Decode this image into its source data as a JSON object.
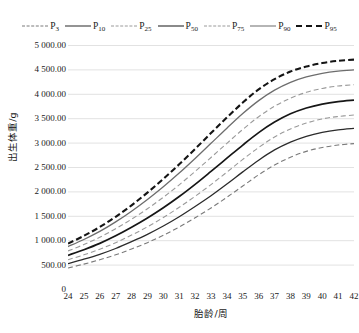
{
  "chart_data": {
    "type": "line",
    "title": "",
    "xlabel": "胎龄/周",
    "ylabel": "出生体重/g",
    "xlim": [
      24,
      42
    ],
    "ylim": [
      0,
      5000
    ],
    "ytick_step": 500,
    "grid": true,
    "legend_position": "top",
    "x": [
      24,
      25,
      26,
      27,
      28,
      29,
      30,
      31,
      32,
      33,
      34,
      35,
      36,
      37,
      38,
      39,
      40,
      41,
      42
    ],
    "xtick_labels": [
      "24",
      "25",
      "26",
      "27",
      "28",
      "29",
      "30",
      "31",
      "32",
      "33",
      "34",
      "35",
      "36",
      "37",
      "38",
      "39",
      "40",
      "41",
      "42"
    ],
    "ytick_labels": [
      "0",
      "500.00",
      "1 000.00",
      "1 500.00",
      "2 000.00",
      "2 500.00",
      "3 000.00",
      "3 500.00",
      "4 000.00",
      "4 500.00",
      "5 000.00"
    ],
    "ytick_values": [
      0,
      500,
      1000,
      1500,
      2000,
      2500,
      3000,
      3500,
      4000,
      4500,
      5000
    ],
    "series": [
      {
        "name": "P3",
        "label": "P",
        "sub": "3",
        "style": "dashed",
        "width": 1.1,
        "color": "#7a7a7a",
        "values": [
          430,
          510,
          600,
          700,
          820,
          950,
          1100,
          1270,
          1460,
          1660,
          1880,
          2110,
          2340,
          2540,
          2700,
          2820,
          2900,
          2950,
          2980
        ]
      },
      {
        "name": "P10",
        "label": "P",
        "sub": "10",
        "style": "solid",
        "width": 1.3,
        "color": "#2b2b2b",
        "values": [
          520,
          610,
          710,
          830,
          970,
          1120,
          1290,
          1480,
          1690,
          1910,
          2150,
          2400,
          2640,
          2850,
          3010,
          3130,
          3210,
          3260,
          3290
        ]
      },
      {
        "name": "P25",
        "label": "P",
        "sub": "25",
        "style": "dashed",
        "width": 1.1,
        "color": "#9a9a9a",
        "values": [
          600,
          700,
          815,
          950,
          1105,
          1275,
          1465,
          1675,
          1900,
          2140,
          2395,
          2655,
          2900,
          3115,
          3280,
          3400,
          3485,
          3535,
          3565
        ]
      },
      {
        "name": "P50",
        "label": "P",
        "sub": "50",
        "style": "solid",
        "width": 1.7,
        "color": "#161616",
        "values": [
          690,
          805,
          935,
          1090,
          1265,
          1455,
          1665,
          1895,
          2145,
          2410,
          2680,
          2950,
          3205,
          3420,
          3590,
          3710,
          3790,
          3840,
          3870
        ]
      },
      {
        "name": "P75",
        "label": "P",
        "sub": "75",
        "style": "dashed",
        "width": 1.1,
        "color": "#9a9a9a",
        "values": [
          780,
          910,
          1060,
          1235,
          1430,
          1645,
          1880,
          2135,
          2410,
          2695,
          2985,
          3270,
          3530,
          3745,
          3910,
          4030,
          4110,
          4160,
          4185
        ]
      },
      {
        "name": "P90",
        "label": "P",
        "sub": "90",
        "style": "solid",
        "width": 1.3,
        "color": "#6d6d6d",
        "values": [
          870,
          1015,
          1180,
          1375,
          1595,
          1835,
          2095,
          2375,
          2675,
          2985,
          3295,
          3595,
          3860,
          4075,
          4235,
          4345,
          4420,
          4465,
          4490
        ]
      },
      {
        "name": "P95",
        "label": "P",
        "sub": "95",
        "style": "dashed",
        "width": 2.1,
        "color": "#141414",
        "values": [
          930,
          1090,
          1270,
          1480,
          1715,
          1975,
          2255,
          2555,
          2870,
          3195,
          3515,
          3820,
          4090,
          4300,
          4455,
          4560,
          4630,
          4675,
          4700
        ]
      }
    ]
  }
}
